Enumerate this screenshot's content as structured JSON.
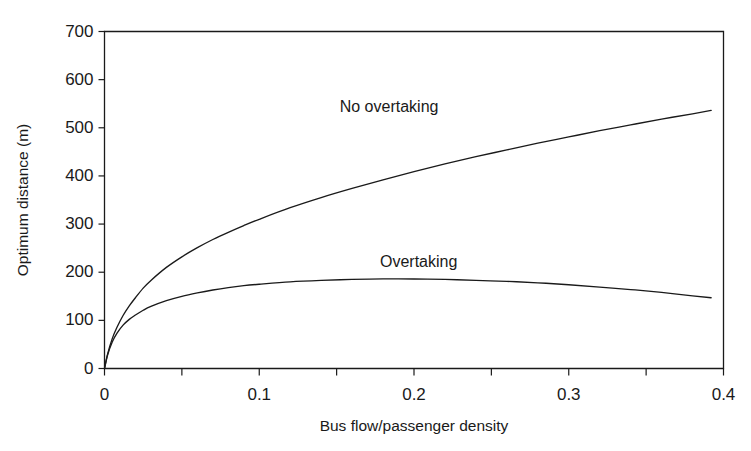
{
  "chart_data": {
    "type": "line",
    "title": "",
    "subtitle": "",
    "xlabel": "Bus flow/passenger density",
    "ylabel": "Optimum distance (m)",
    "xlim": [
      0,
      0.4
    ],
    "ylim": [
      0,
      700
    ],
    "grid": false,
    "legend_position": "inline-annotation",
    "background_color": "#ffffff",
    "line_color": "#1a1a1a",
    "axis_color": "#1a1a1a",
    "x_ticks_major": [
      0,
      0.1,
      0.2,
      0.3,
      0.4
    ],
    "x_tick_labels": [
      "0",
      "0.1",
      "0.2",
      "0.3",
      "0.4"
    ],
    "x_ticks_minor": [
      0.05,
      0.15,
      0.25,
      0.35
    ],
    "y_ticks": [
      0,
      100,
      200,
      300,
      400,
      500,
      600,
      700
    ],
    "y_tick_labels": [
      "0",
      "100",
      "200",
      "300",
      "400",
      "500",
      "600",
      "700"
    ],
    "series": [
      {
        "name": "No overtaking",
        "annotation_x": 0.152,
        "annotation_y": 542,
        "x": [
          0,
          0.002,
          0.005,
          0.008,
          0.012,
          0.016,
          0.02,
          0.025,
          0.03,
          0.04,
          0.05,
          0.06,
          0.07,
          0.08,
          0.09,
          0.1,
          0.12,
          0.14,
          0.16,
          0.18,
          0.2,
          0.22,
          0.24,
          0.26,
          0.28,
          0.3,
          0.32,
          0.34,
          0.36,
          0.38,
          0.392
        ],
        "values": [
          0,
          30,
          62,
          85,
          110,
          130,
          147,
          167,
          183,
          210,
          232,
          251,
          268,
          283,
          297,
          310,
          334,
          355,
          374,
          392,
          409,
          425,
          440,
          454,
          468,
          481,
          494,
          506,
          518,
          529,
          536
        ]
      },
      {
        "name": "Overtaking",
        "annotation_x": 0.178,
        "annotation_y": 219,
        "x": [
          0,
          0.002,
          0.005,
          0.008,
          0.012,
          0.016,
          0.02,
          0.025,
          0.03,
          0.04,
          0.05,
          0.06,
          0.07,
          0.08,
          0.09,
          0.1,
          0.12,
          0.14,
          0.16,
          0.18,
          0.2,
          0.22,
          0.24,
          0.26,
          0.28,
          0.3,
          0.32,
          0.34,
          0.36,
          0.38,
          0.392
        ],
        "values": [
          0,
          28,
          55,
          73,
          90,
          102,
          111,
          121,
          129,
          141,
          150,
          157,
          163,
          168,
          172,
          175,
          180,
          183,
          185,
          186,
          186,
          185,
          183,
          181,
          178,
          174,
          169,
          164,
          158,
          151,
          147
        ]
      }
    ]
  },
  "axis": {
    "x_title": "Bus flow/passenger density",
    "y_title": "Optimum distance (m)"
  },
  "annotations": {
    "no_overtaking": "No overtaking",
    "overtaking": "Overtaking"
  },
  "colors": {
    "line": "#1a1a1a",
    "axis": "#1a1a1a",
    "background": "#ffffff",
    "text": "#1a1a1a"
  }
}
